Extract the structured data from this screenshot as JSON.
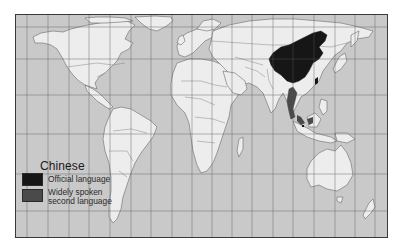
{
  "map": {
    "subject": "Chinese",
    "projection_grid": {
      "vertical_lines_x": [
        26,
        47,
        68,
        88,
        109,
        130,
        150,
        171,
        191,
        211,
        231,
        251,
        272,
        292,
        313,
        334,
        354,
        374
      ],
      "horizontal_lines_y": [
        26,
        58,
        94,
        133,
        173,
        210
      ]
    },
    "colors": {
      "ocean": "#c9c9c9",
      "land": "#ededed",
      "border": "#6a6a6a",
      "grid": "#5a5a5a",
      "official": "#161616",
      "widely_spoken": "#4a4a4a"
    },
    "highlighted_regions": [
      {
        "name": "China",
        "category": "official"
      },
      {
        "name": "Taiwan",
        "category": "official"
      },
      {
        "name": "Singapore",
        "category": "official"
      },
      {
        "name": "Thailand / Malaysia region",
        "category": "widely_spoken"
      }
    ]
  },
  "legend": {
    "title": "Chinese",
    "items": [
      {
        "label_line1": "Official language",
        "label_line2": "",
        "color": "#161616"
      },
      {
        "label_line1": "Widely spoken",
        "label_line2": "second language",
        "color": "#4a4a4a"
      }
    ]
  }
}
